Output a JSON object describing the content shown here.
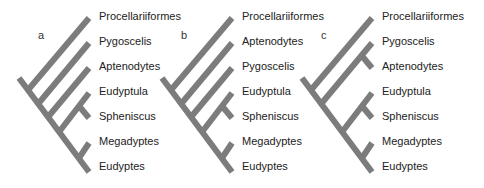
{
  "figure": {
    "line_color": "#7c7c7c",
    "panels": [
      {
        "letter": "a",
        "taxa": [
          "Procellariiformes",
          "Pygoscelis",
          "Aptenodytes",
          "Eudyptula",
          "Spheniscus",
          "Megadyptes",
          "Eudyptes"
        ],
        "topology": "(Procellariiformes,(Pygoscelis,(Aptenodytes,((Eudyptula,Spheniscus),(Megadyptes,Eudyptes)))))"
      },
      {
        "letter": "b",
        "taxa": [
          "Procellariiformes",
          "Aptenodytes",
          "Pygoscelis",
          "Eudyptula",
          "Spheniscus",
          "Megadyptes",
          "Eudyptes"
        ],
        "topology": "(Procellariiformes,(Aptenodytes,(Pygoscelis,((Eudyptula,Spheniscus),(Megadyptes,Eudyptes)))))"
      },
      {
        "letter": "c",
        "taxa": [
          "Procellariiformes",
          "Pygoscelis",
          "Aptenodytes",
          "Eudyptula",
          "Spheniscus",
          "Megadyptes",
          "Eudyptes"
        ],
        "topology": "(Procellariiformes,((Pygoscelis,Aptenodytes),((Eudyptula,Spheniscus),(Megadyptes,Eudyptes))))"
      }
    ]
  }
}
